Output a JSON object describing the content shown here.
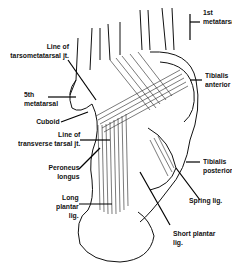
{
  "figure": {
    "labels": [
      {
        "id": "first-metatarsal",
        "lines": [
          "1st",
          "metatarsal"
        ]
      },
      {
        "id": "line-of-tarsometatarsal-jt",
        "lines": [
          "Line of",
          "tarsometatarsal jt."
        ]
      },
      {
        "id": "tibialis-anterior",
        "lines": [
          "Tibialis",
          "anterior"
        ]
      },
      {
        "id": "fifth-metatarsal",
        "lines": [
          "5th",
          "metatarsal"
        ]
      },
      {
        "id": "cuboid",
        "lines": [
          "Cuboid"
        ]
      },
      {
        "id": "line-of-transverse-tarsal-jt",
        "lines": [
          "Line of",
          "transverse tarsal jt."
        ]
      },
      {
        "id": "tibialis-posterior",
        "lines": [
          "Tibialis",
          "posterior"
        ]
      },
      {
        "id": "peroneus-longus",
        "lines": [
          "Peroneus",
          "longus"
        ]
      },
      {
        "id": "spring-lig",
        "lines": [
          "Spring lig."
        ]
      },
      {
        "id": "long-plantar-lig",
        "lines": [
          "Long",
          "plantar",
          "lig."
        ]
      },
      {
        "id": "short-plantar-lig",
        "lines": [
          "Short plantar",
          "lig."
        ]
      }
    ]
  }
}
